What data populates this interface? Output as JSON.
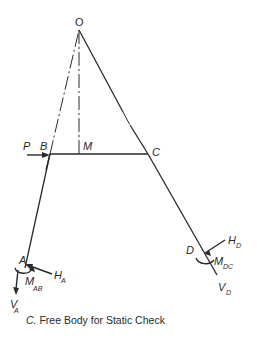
{
  "figure": {
    "caption_prefix": "C.",
    "caption_text": " Free Body for Static Check",
    "points": {
      "O": {
        "label": "O",
        "x": 79,
        "y": 30
      },
      "B": {
        "label": "B",
        "x": 50,
        "y": 154
      },
      "M": {
        "label": "M",
        "x": 79,
        "y": 154
      },
      "C": {
        "label": "C",
        "x": 148,
        "y": 154
      },
      "A": {
        "label": "A",
        "x": 25,
        "y": 268
      },
      "D": {
        "label": "D",
        "x": 205,
        "y": 253
      }
    },
    "loads": {
      "P": {
        "label": "P",
        "direction": "right"
      }
    },
    "reactions": {
      "H_A": {
        "main": "H",
        "sub": "A"
      },
      "V_A": {
        "main": "V",
        "sub": "A"
      },
      "M_AB": {
        "main": "M",
        "sub": "AB"
      },
      "H_D": {
        "main": "H",
        "sub": "D"
      },
      "V_D": {
        "main": "V",
        "sub": "D"
      },
      "M_DC": {
        "main": "M",
        "sub": "DC"
      }
    },
    "colors": {
      "ink": "#2a2a2a",
      "background": "#ffffff"
    }
  }
}
